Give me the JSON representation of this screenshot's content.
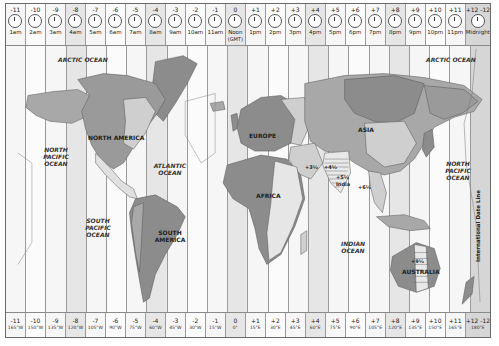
{
  "header": {
    "zones": [
      {
        "offset": "-11",
        "time": "1am"
      },
      {
        "offset": "-10",
        "time": "2am"
      },
      {
        "offset": "-9",
        "time": "3am"
      },
      {
        "offset": "-8",
        "time": "4am"
      },
      {
        "offset": "-7",
        "time": "5am"
      },
      {
        "offset": "-6",
        "time": "6am"
      },
      {
        "offset": "-5",
        "time": "7am"
      },
      {
        "offset": "-4",
        "time": "8am"
      },
      {
        "offset": "-3",
        "time": "9am"
      },
      {
        "offset": "-2",
        "time": "10am"
      },
      {
        "offset": "-1",
        "time": "11am"
      },
      {
        "offset": "0",
        "time": "Noon",
        "sub": "(GMT)"
      },
      {
        "offset": "+1",
        "time": "1pm"
      },
      {
        "offset": "+2",
        "time": "2pm"
      },
      {
        "offset": "+3",
        "time": "3pm"
      },
      {
        "offset": "+4",
        "time": "4pm"
      },
      {
        "offset": "+5",
        "time": "5pm"
      },
      {
        "offset": "+6",
        "time": "6pm"
      },
      {
        "offset": "+7",
        "time": "7pm"
      },
      {
        "offset": "+8",
        "time": "8pm"
      },
      {
        "offset": "+9",
        "time": "9pm"
      },
      {
        "offset": "+10",
        "time": "10pm"
      },
      {
        "offset": "+11",
        "time": "11pm"
      },
      {
        "offset": "+12 -12",
        "time": "Midnight"
      }
    ]
  },
  "footer": {
    "zones": [
      {
        "offset": "-11",
        "longitude": "165°W"
      },
      {
        "offset": "-10",
        "longitude": "150°W"
      },
      {
        "offset": "-9",
        "longitude": "135°W"
      },
      {
        "offset": "-8",
        "longitude": "120°W"
      },
      {
        "offset": "-7",
        "longitude": "105°W"
      },
      {
        "offset": "-6",
        "longitude": "90°W"
      },
      {
        "offset": "-5",
        "longitude": "75°W"
      },
      {
        "offset": "-4",
        "longitude": "60°W"
      },
      {
        "offset": "-3",
        "longitude": "45°W"
      },
      {
        "offset": "-2",
        "longitude": "30°W"
      },
      {
        "offset": "-1",
        "longitude": "15°W"
      },
      {
        "offset": "0",
        "longitude": "0°"
      },
      {
        "offset": "+1",
        "longitude": "15°E"
      },
      {
        "offset": "+2",
        "longitude": "30°E"
      },
      {
        "offset": "+3",
        "longitude": "45°E"
      },
      {
        "offset": "+4",
        "longitude": "60°E"
      },
      {
        "offset": "+5",
        "longitude": "75°E"
      },
      {
        "offset": "+6",
        "longitude": "90°E"
      },
      {
        "offset": "+7",
        "longitude": "105°E"
      },
      {
        "offset": "+8",
        "longitude": "120°E"
      },
      {
        "offset": "+9",
        "longitude": "135°E"
      },
      {
        "offset": "+10",
        "longitude": "150°E"
      },
      {
        "offset": "+11",
        "longitude": "165°E"
      },
      {
        "offset": "+12 -12",
        "longitude": "180°E"
      }
    ]
  },
  "map": {
    "continents": {
      "north_america": "NORTH AMERICA",
      "south_america": "SOUTH AMERICA",
      "europe": "EUROPE",
      "africa": "AFRICA",
      "asia": "ASIA",
      "australia": "AUSTRALIA"
    },
    "oceans": {
      "arctic_west": "ARCTIC OCEAN",
      "arctic_east": "ARCTIC OCEAN",
      "north_pacific_west": "NORTH PACIFIC OCEAN",
      "north_pacific_east": "NORTH PACIFIC OCEAN",
      "south_pacific": "SOUTH PACIFIC OCEAN",
      "atlantic": "ATLANTIC OCEAN",
      "indian": "INDIAN OCEAN"
    },
    "annotations": {
      "iran": "+3½",
      "afghanistan": "+4½",
      "india_offset": "+5½",
      "india": "India",
      "myanmar": "+6½",
      "australia_central": "+9½",
      "date_line": "International Date Line"
    }
  },
  "colors": {
    "frame_border": "#6a6a6a",
    "column_divider": "#9a9a9a",
    "ocean_light": "#f6f6f6",
    "land_light": "#cfcfcf",
    "land_mid": "#a8a8a8",
    "land_dark": "#8c8c8c"
  }
}
